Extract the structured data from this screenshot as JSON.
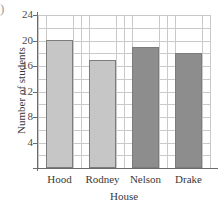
{
  "corner_mark": ")",
  "chart_data": {
    "type": "bar",
    "title": "",
    "categories": [
      "Hood",
      "Rodney",
      "Nelson",
      "Drake"
    ],
    "values": [
      20,
      17,
      19,
      18
    ],
    "series": [
      {
        "name": "Number of students",
        "values": [
          20,
          17,
          19,
          18
        ]
      }
    ],
    "bar_colors": [
      "#c6c6c6",
      "#c6c6c6",
      "#8d8d8d",
      "#8d8d8d"
    ],
    "bar_border_color": "#7c7c7c",
    "xlabel": "House",
    "ylabel": "Number of students",
    "ylim": [
      0,
      24
    ],
    "xlim": [
      0,
      4
    ],
    "ytick_labels": [
      "4",
      "8",
      "12",
      "16",
      "20",
      "24"
    ],
    "ytick_values": [
      4,
      8,
      12,
      16,
      20,
      24
    ],
    "gridline_values": [
      2,
      4,
      6,
      8,
      10,
      12,
      14,
      16,
      18,
      20,
      22,
      24
    ],
    "grid": true,
    "grid_color": "#c9c9c9",
    "axis_color": "#6b6b6b",
    "legend": null,
    "legend_position": "none",
    "background": "#ffffff"
  }
}
